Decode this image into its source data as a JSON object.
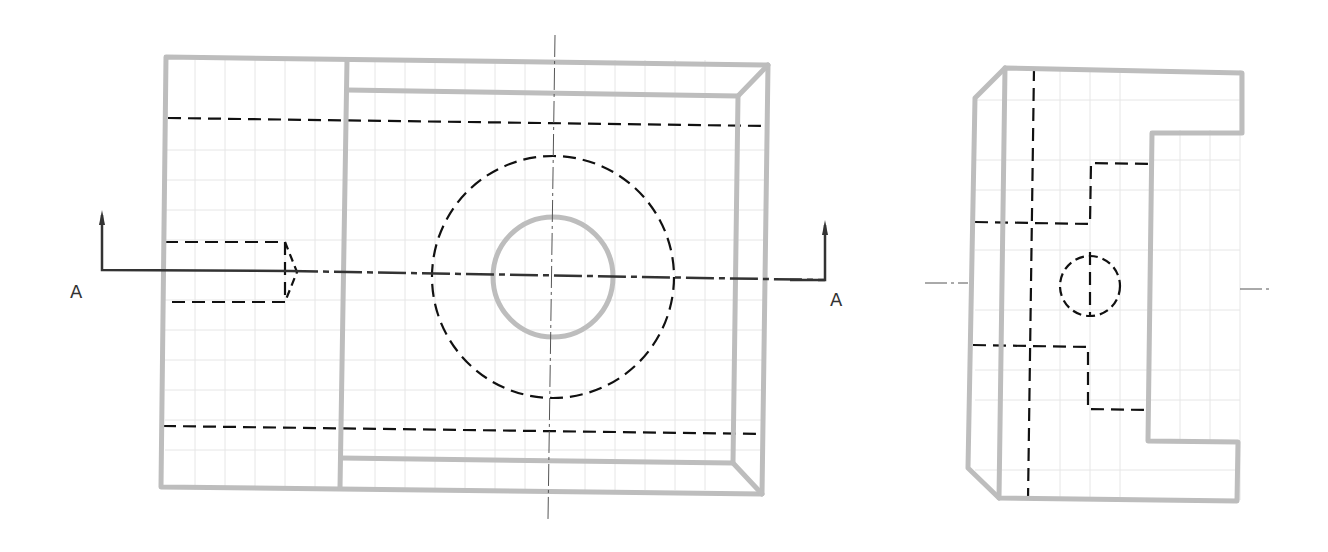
{
  "drawing": {
    "type": "orthographic-projection",
    "views": [
      {
        "name": "front-view",
        "features": [
          "outer-rectangle",
          "inner-recessed-rectangle",
          "chamfer-edges-right",
          "through-hole-solid",
          "counterbore-hidden-circle",
          "hidden-slot-lines",
          "side-blind-hole-hidden"
        ]
      },
      {
        "name": "side-view",
        "features": [
          "stepped-profile",
          "chamfer-left",
          "hidden-hole-circle",
          "hidden-step-lines"
        ]
      }
    ],
    "section": {
      "label_left": "A",
      "label_right": "A",
      "name": "Section A-A"
    },
    "colors": {
      "visible_edge": "#bdbdbd",
      "hidden_edge": "#111111",
      "center_line": "#555555",
      "grid": "#e6e6e6"
    }
  }
}
